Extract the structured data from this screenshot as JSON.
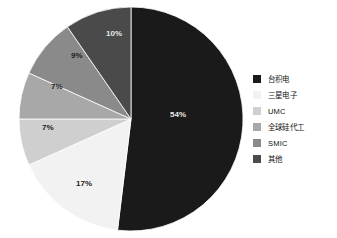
{
  "chart_data": {
    "type": "pie",
    "title": "",
    "categories": [
      "台积电",
      "三星电子",
      "UMC",
      "全球硅代工",
      "SMIC",
      "其他"
    ],
    "values": [
      54,
      17,
      7,
      7,
      9,
      10
    ],
    "value_labels": [
      "54%",
      "17%",
      "7%",
      "7%",
      "9%",
      "10%"
    ],
    "colors": [
      "#1a1a1a",
      "#f2f2f2",
      "#cfcfcf",
      "#a8a8a8",
      "#8a8a8a",
      "#4a4a4a"
    ],
    "legend_position": "right",
    "grid": false,
    "xlabel": "",
    "ylabel": "",
    "start_angle_deg": 0,
    "direction": "clockwise"
  },
  "legend": {
    "items": [
      {
        "label": "台积电",
        "color": "#1a1a1a"
      },
      {
        "label": "三星电子",
        "color": "#f2f2f2"
      },
      {
        "label": "UMC",
        "color": "#cfcfcf"
      },
      {
        "label": "全球硅代工",
        "color": "#a8a8a8"
      },
      {
        "label": "SMIC",
        "color": "#8a8a8a"
      },
      {
        "label": "其他",
        "color": "#4a4a4a"
      }
    ]
  },
  "slice_labels": [
    {
      "text": "54%",
      "x": 152,
      "y": 111,
      "tone": "light"
    },
    {
      "text": "17%",
      "x": 58,
      "y": 180,
      "tone": "dark"
    },
    {
      "text": "7%",
      "x": 24,
      "y": 124,
      "tone": "dark"
    },
    {
      "text": "7%",
      "x": 33,
      "y": 83,
      "tone": "dark"
    },
    {
      "text": "9%",
      "x": 53,
      "y": 52,
      "tone": "dark"
    },
    {
      "text": "10%",
      "x": 88,
      "y": 30,
      "tone": "light"
    }
  ]
}
